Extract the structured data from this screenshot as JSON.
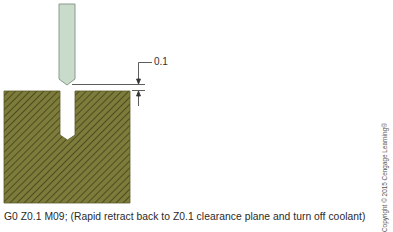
{
  "diagram": {
    "dimension_label": "0.1",
    "caption": "G0 Z0.1 M09;  (Rapid retract back to Z0.1 clearance plane and turn off coolant)",
    "copyright": "Copyright © 2015 Cengage Learning®",
    "colors": {
      "tool_fill": "#c9dccb",
      "tool_stroke": "#8a9a8c",
      "stock_fill": "#7d7c3a",
      "stock_hatch": "#3f3f1c",
      "lines": "#333333"
    },
    "elements": {
      "tool": "drill-tool",
      "stock": "workpiece-stock",
      "hole": "drilled-hole",
      "dimension": "clearance-dimension"
    }
  }
}
